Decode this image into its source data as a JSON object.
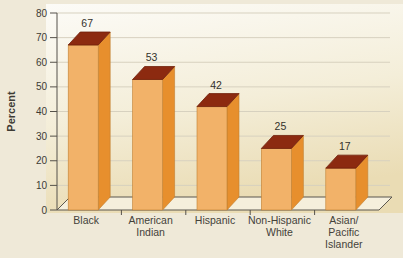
{
  "figure": {
    "ylabel": "Percent"
  },
  "chart_data": {
    "type": "bar",
    "projection": "3d",
    "title": "",
    "xlabel": "",
    "ylabel": "Percent",
    "ylim": [
      0,
      80
    ],
    "ytick_step": 10,
    "grid": true,
    "legend": false,
    "categories": [
      "Black",
      "American Indian",
      "Hispanic",
      "Non-Hispanic White",
      "Asian/Pacific Islander"
    ],
    "category_lines": [
      [
        "Black"
      ],
      [
        "American",
        "Indian"
      ],
      [
        "Hispanic"
      ],
      [
        "Non-Hispanic",
        "White"
      ],
      [
        "Asian/",
        "Pacific",
        "Islander"
      ]
    ],
    "values": [
      67,
      53,
      42,
      25,
      17
    ],
    "value_labels": [
      "67",
      "53",
      "42",
      "25",
      "17"
    ],
    "ytick_labels": [
      "0",
      "10",
      "20",
      "30",
      "40",
      "50",
      "60",
      "70",
      "80"
    ],
    "colors": {
      "bar_front": "#f2b269",
      "bar_side": "#e78f2d",
      "bar_top": "#8c2a10",
      "bar_edge": "#c08033",
      "bar_top_edge": "#701f0a",
      "grid_line": "#d7d1bf",
      "axis_line": "#55514a",
      "floor_outline": "#5b574e",
      "floor_fill": "#f5efdc",
      "tick_text": "#3d3b34",
      "category_text": "#44423a",
      "value_text": "#33312b",
      "page_bg": "#efe9d8",
      "plot_bg_top": "#fcfbf7",
      "plot_bg_mid": "#f4eed9",
      "plot_bg_bottom": "#eadcb4"
    }
  }
}
